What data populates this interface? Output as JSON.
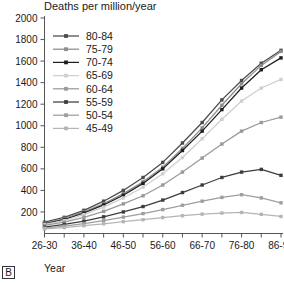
{
  "figure": {
    "panel_label": "B",
    "title": "Deaths per million/year",
    "xlabel": "Year"
  },
  "chart_data": {
    "type": "line",
    "title": "Deaths per million/year",
    "subtitle": "",
    "xlabel": "Year",
    "ylabel": "Deaths per million/year",
    "x_tick_labels": [
      "26-30",
      "36-40",
      "46-50",
      "56-60",
      "66-70",
      "76-80",
      "86-90"
    ],
    "categories": [
      "26-30",
      "31-35",
      "36-40",
      "41-45",
      "46-50",
      "51-55",
      "56-60",
      "61-65",
      "66-70",
      "71-75",
      "76-80",
      "81-85",
      "86-90"
    ],
    "y_ticks": [
      200,
      400,
      600,
      800,
      1000,
      1200,
      1400,
      1600,
      1800,
      2000
    ],
    "ylim": [
      0,
      2000
    ],
    "grid": false,
    "legend_position": "upper-left-inside",
    "marker": "square",
    "series": [
      {
        "name": "80-84",
        "color": "#4a4a4a",
        "values": [
          105,
          150,
          215,
          300,
          400,
          520,
          660,
          840,
          1030,
          1240,
          1420,
          1580,
          1700
        ]
      },
      {
        "name": "75-79",
        "color": "#8c8c8c",
        "values": [
          95,
          140,
          200,
          275,
          370,
          480,
          615,
          790,
          980,
          1190,
          1390,
          1560,
          1690
        ]
      },
      {
        "name": "70-74",
        "color": "#1f1f1f",
        "values": [
          90,
          130,
          190,
          265,
          355,
          465,
          600,
          770,
          950,
          1150,
          1350,
          1520,
          1630
        ]
      },
      {
        "name": "65-69",
        "color": "#cfcfcf",
        "values": [
          85,
          120,
          175,
          245,
          330,
          430,
          555,
          705,
          880,
          1060,
          1230,
          1350,
          1430
        ]
      },
      {
        "name": "60-64",
        "color": "#9a9a9a",
        "values": [
          75,
          105,
          150,
          205,
          275,
          350,
          450,
          570,
          700,
          830,
          950,
          1030,
          1080
        ]
      },
      {
        "name": "55-59",
        "color": "#3d3d3d",
        "values": [
          60,
          85,
          115,
          155,
          200,
          250,
          310,
          380,
          450,
          520,
          570,
          595,
          540
        ]
      },
      {
        "name": "50-54",
        "color": "#9e9e9e",
        "values": [
          50,
          68,
          92,
          120,
          152,
          185,
          222,
          262,
          300,
          335,
          360,
          330,
          285
        ]
      },
      {
        "name": "45-49",
        "color": "#b5b5b5",
        "values": [
          42,
          55,
          72,
          90,
          110,
          128,
          148,
          165,
          180,
          190,
          195,
          178,
          158
        ]
      }
    ]
  }
}
